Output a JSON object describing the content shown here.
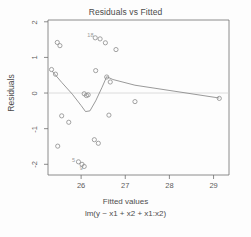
{
  "chart_data": {
    "type": "scatter",
    "title": "Residuals vs Fitted",
    "xlabel": "Fitted values",
    "sublabel": "lm(y ~ x1 + x2 + x1:x2)",
    "ylabel": "Residuals",
    "xlim": [
      25.25,
      29.35
    ],
    "ylim": [
      -2.3,
      2.05
    ],
    "xticks": [
      "26",
      "27",
      "28",
      "29"
    ],
    "xtick_values": [
      26,
      27,
      28,
      29
    ],
    "yticks": [
      "2",
      "1",
      "0",
      "-1",
      "-2"
    ],
    "ytick_values": [
      2,
      1,
      0,
      -1,
      -2
    ],
    "grid": false,
    "legend": null,
    "zero_reference_line": 0,
    "points": [
      {
        "x": 25.33,
        "y": 0.66
      },
      {
        "x": 25.42,
        "y": 0.53
      },
      {
        "x": 25.46,
        "y": 1.42
      },
      {
        "x": 25.52,
        "y": 1.33
      },
      {
        "x": 25.47,
        "y": -1.49
      },
      {
        "x": 25.56,
        "y": -0.64
      },
      {
        "x": 25.72,
        "y": -0.82
      },
      {
        "x": 25.94,
        "y": -1.93
      },
      {
        "x": 26.02,
        "y": -2.0
      },
      {
        "x": 26.07,
        "y": -2.06
      },
      {
        "x": 26.07,
        "y": -0.02
      },
      {
        "x": 26.12,
        "y": -0.07
      },
      {
        "x": 26.16,
        "y": -0.05
      },
      {
        "x": 26.3,
        "y": -1.31
      },
      {
        "x": 26.39,
        "y": -1.41
      },
      {
        "x": 26.33,
        "y": 0.63
      },
      {
        "x": 26.32,
        "y": 1.55
      },
      {
        "x": 26.43,
        "y": 1.52
      },
      {
        "x": 26.55,
        "y": 1.41
      },
      {
        "x": 26.58,
        "y": 0.45
      },
      {
        "x": 26.66,
        "y": 0.31
      },
      {
        "x": 26.63,
        "y": -0.62
      },
      {
        "x": 26.79,
        "y": 1.22
      },
      {
        "x": 27.22,
        "y": -0.24
      },
      {
        "x": 29.13,
        "y": -0.15
      }
    ],
    "point_labels": [
      {
        "text": "18",
        "x": 26.3,
        "y": 1.62
      },
      {
        "text": "5",
        "x": 25.95,
        "y": -1.88
      },
      {
        "text": "9",
        "x": 26.13,
        "y": -2.11
      }
    ],
    "smoother": {
      "name": "loess",
      "points": [
        {
          "x": 25.34,
          "y": 0.62
        },
        {
          "x": 25.56,
          "y": 0.3
        },
        {
          "x": 25.8,
          "y": -0.03
        },
        {
          "x": 26.0,
          "y": -0.35
        },
        {
          "x": 26.1,
          "y": -0.52
        },
        {
          "x": 26.2,
          "y": -0.5
        },
        {
          "x": 26.33,
          "y": -0.22
        },
        {
          "x": 26.47,
          "y": 0.15
        },
        {
          "x": 26.58,
          "y": 0.46
        },
        {
          "x": 26.72,
          "y": 0.38
        },
        {
          "x": 27.22,
          "y": 0.22
        },
        {
          "x": 29.13,
          "y": -0.14
        }
      ]
    },
    "colors": {
      "point": "#8c8c8c",
      "line": "#808080",
      "axis": "#6e6e6e",
      "zero_line": "#cfcfcf",
      "text": "#4a4a4a",
      "background": "#fdfdfd"
    }
  }
}
